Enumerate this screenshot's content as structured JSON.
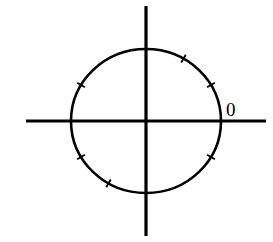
{
  "diagram": {
    "type": "unit-circle",
    "colors": {
      "stroke": "#000000",
      "background": "#ffffff"
    },
    "origin_label": "0",
    "center": {
      "x": 146,
      "y": 121
    },
    "radius": {
      "rx": 75,
      "ry": 72
    },
    "axes": {
      "horizontal": {
        "x1": 26,
        "x2": 266,
        "y": 121
      },
      "vertical": {
        "x": 146,
        "y1": 6,
        "y2": 236
      }
    },
    "tick_angles_deg": [
      30,
      60,
      150,
      210,
      240,
      330
    ]
  }
}
